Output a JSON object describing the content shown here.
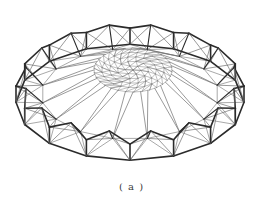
{
  "figure": {
    "caption": "( a )",
    "colors": {
      "background": "#ffffff",
      "outer_members": "#2b2b2b",
      "inner_members": "#6e6e6e",
      "mesh": "#808080"
    },
    "geometry": {
      "center": [
        130,
        96
      ],
      "outer_rx": 114,
      "outer_ry": 58,
      "lower_offset": 14,
      "modules": 16,
      "tooth_height": 18,
      "disc_center": [
        133,
        70
      ],
      "disc_rx": 39,
      "disc_ry": 22,
      "disc_rings": 5
    }
  }
}
